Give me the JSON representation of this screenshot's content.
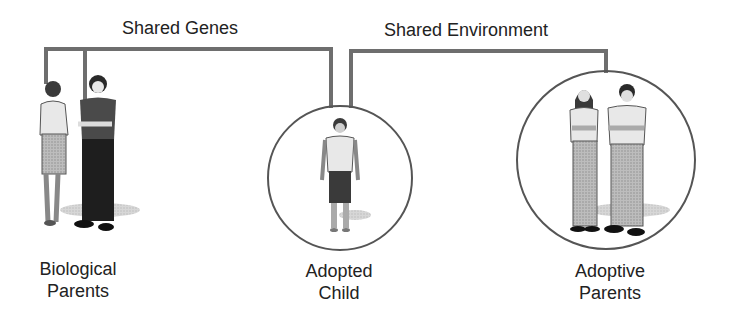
{
  "diagram": {
    "type": "adoption-study",
    "connectors": [
      {
        "label": "Shared Genes",
        "from": "biological-parents",
        "to": "adopted-child"
      },
      {
        "label": "Shared Environment",
        "from": "adopted-child",
        "to": "adoptive-parents"
      }
    ],
    "groups": [
      {
        "id": "biological-parents",
        "line1": "Biological",
        "line2": "Parents",
        "circled": false
      },
      {
        "id": "adopted-child",
        "line1": "Adopted",
        "line2": "Child",
        "circled": true
      },
      {
        "id": "adoptive-parents",
        "line1": "Adoptive",
        "line2": "Parents",
        "circled": true
      }
    ],
    "colors": {
      "connector": "#6e6e6e",
      "circle": "#555555",
      "text": "#222222"
    }
  }
}
